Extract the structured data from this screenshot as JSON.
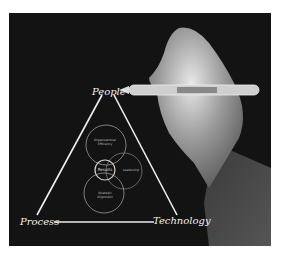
{
  "image": {
    "description": "Hand holding a pen drawing a triangle diagram on a dark background",
    "labels": {
      "top": "People",
      "bottom_left": "Process",
      "bottom_right": "Technology"
    },
    "circles": {
      "top": "Organizational Efficiency",
      "center": "Results",
      "right": "Leadership",
      "bottom": "Strategic Alignment"
    },
    "colors": {
      "background": "#131313",
      "line": "#eeeeee",
      "border": "#ffffff"
    }
  }
}
